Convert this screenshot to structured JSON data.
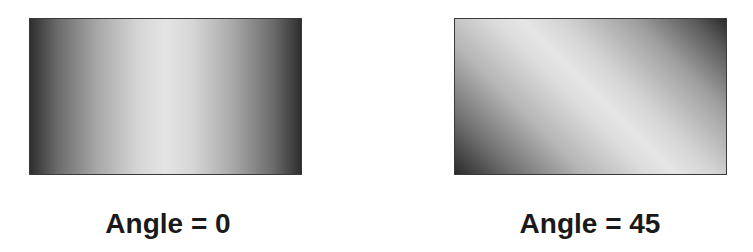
{
  "figure": {
    "panels": [
      {
        "caption": "Angle = 0",
        "gradient": {
          "angle_degrees": 0,
          "style": "linear, dark edges to light center",
          "edge_color": "#2e2e2e",
          "center_color": "#e4e4e4"
        }
      },
      {
        "caption": "Angle = 45",
        "gradient": {
          "angle_degrees": 45,
          "style": "linear diagonal, dark corners to light diagonal band",
          "edge_color": "#2a2a2a",
          "center_color": "#e6e6e6"
        }
      }
    ],
    "colors": {
      "background": "#ffffff",
      "border": "#3a3a3a",
      "caption_text": "#1a1a1a"
    }
  }
}
